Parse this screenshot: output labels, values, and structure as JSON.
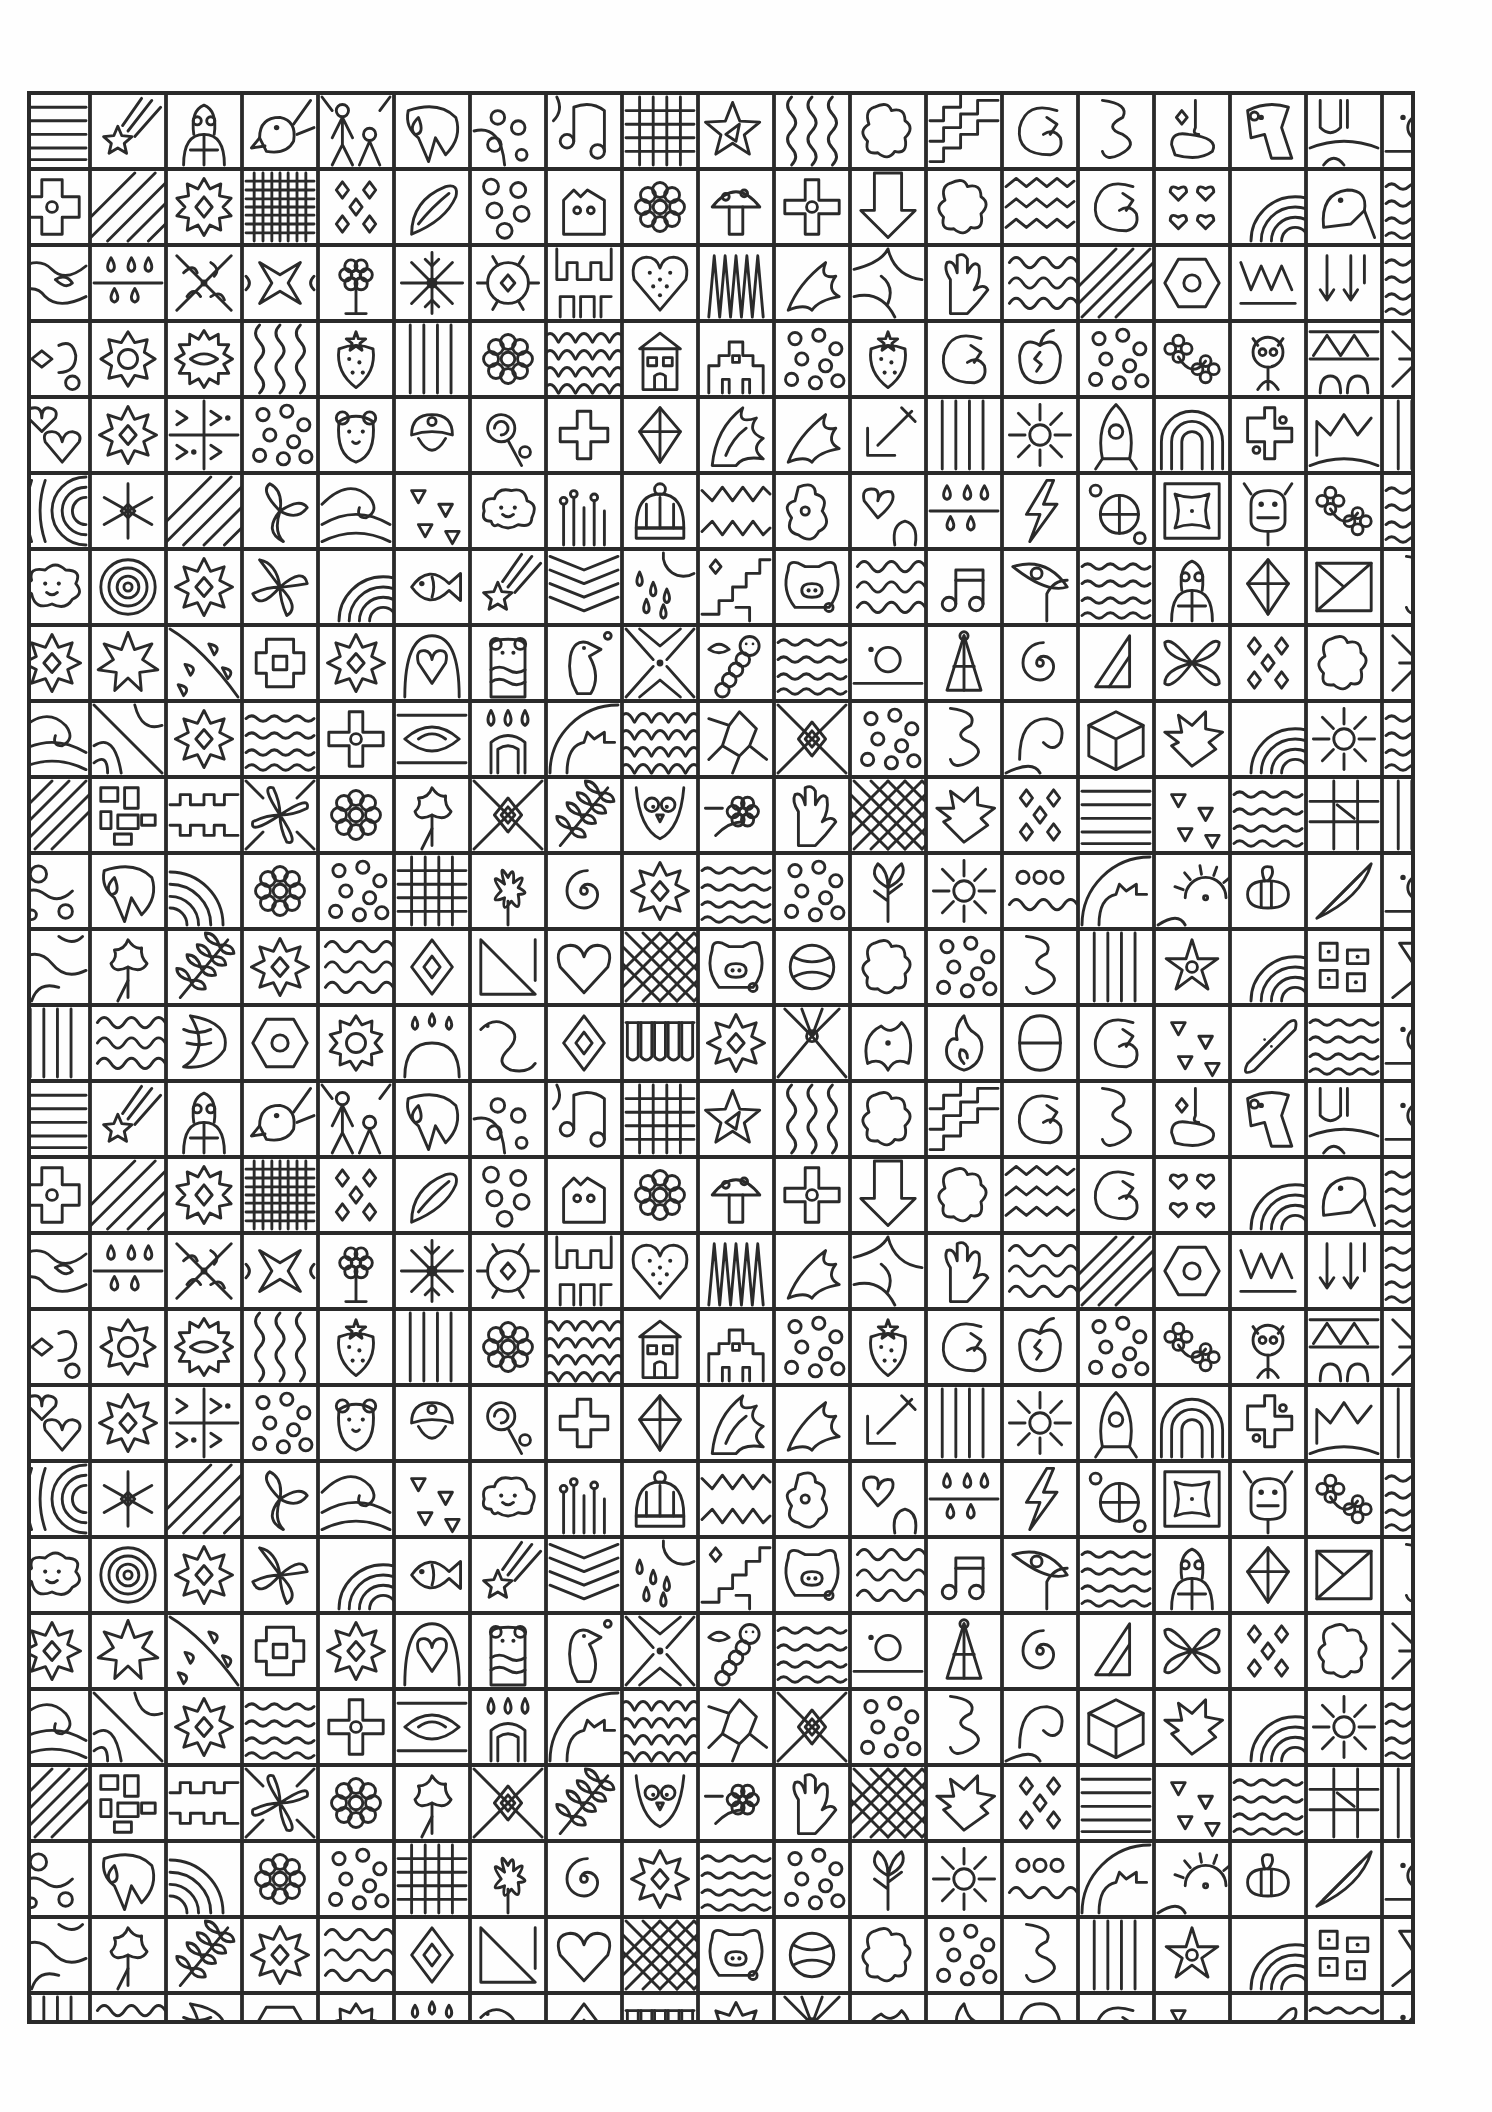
{
  "page": {
    "type": "coloring-page",
    "background_color": "#fefefe",
    "ink_color": "#2a2a2a"
  },
  "grid": {
    "left": 29,
    "top": 93,
    "right": 1413,
    "bottom": 2022,
    "first_col_width": 61,
    "cell": 76,
    "cols": 19,
    "rows": 26,
    "repeat_period_rows": 13,
    "border_width": 4,
    "line_width": 3.2
  },
  "motif_rows": [
    [
      "stripes-h",
      "shooting-star",
      "turtle",
      "bird",
      "figures",
      "leaf-drop",
      "dots-blob",
      "music-notes",
      "grid-coarse",
      "star-tri",
      "wavy-v",
      "puzzle-blob",
      "zigzag-steps",
      "swirl-c",
      "squiggle-s",
      "blob-oval",
      "dog-head",
      "wave-u",
      "dots-c"
    ],
    [
      "cross-block",
      "diag-lines",
      "sun-diamond",
      "grid-fine",
      "diamonds",
      "leaf-swirl",
      "circles",
      "house-cat",
      "flower",
      "mushroom",
      "flower-cross",
      "arrow-down",
      "puzzle-blob",
      "zigzag",
      "swirl-c",
      "hearts4",
      "rainbow",
      "leaf-bird",
      "wave-h"
    ],
    [
      "wavy-blob",
      "drops",
      "leaf-x",
      "cross-star",
      "flower-tree",
      "snowflake",
      "sun-gear",
      "castle",
      "heart-dots",
      "spikes",
      "leaf-flame",
      "blob-net",
      "hand",
      "squiggle",
      "diag-stripes",
      "hexagon",
      "zigzag-w",
      "arrows-down",
      "wave-h"
    ],
    [
      "diamond-c",
      "sun-flower",
      "flower-oval",
      "wavy-v",
      "strawberry",
      "stripes-v",
      "flower",
      "scales",
      "house",
      "castle2",
      "dots",
      "strawberry",
      "swirl-c",
      "apple",
      "dots",
      "flower4",
      "monkey",
      "triangles",
      "arrow-x"
    ],
    [
      "hearts",
      "star-diamond",
      "zigzag-grid",
      "dots",
      "bear",
      "mushroom-s",
      "lollipop",
      "plus",
      "gem",
      "flame",
      "leaf-flame",
      "arrow-dl",
      "stripes-v",
      "sun-ray",
      "rocket",
      "rainbow-u",
      "cross-dots",
      "zigzag-m",
      "stripes-v"
    ],
    [
      "arcs",
      "asterisk",
      "diag-lines",
      "leaf-3",
      "wave-swirl",
      "triangles-s",
      "cloud",
      "grass",
      "beanie",
      "wave-teeth",
      "blob-bead",
      "heart-blob",
      "drops",
      "lightning",
      "ball-x",
      "frame",
      "cow",
      "flower4",
      "wave-h"
    ],
    [
      "cloud-face",
      "target",
      "star-diamond",
      "pinwheel",
      "rainbow",
      "fish",
      "shooting-star",
      "chevrons",
      "drops-sun",
      "steps",
      "pig",
      "squiggle",
      "music-note",
      "leaf-eye",
      "wave-h",
      "turtle",
      "gem",
      "envelope",
      "squiggle-s"
    ],
    [
      "star-diamond",
      "leaf-star",
      "leaf-drops",
      "puzzle-cross",
      "star-diamond",
      "heart-arch",
      "bear-stripe",
      "bird2",
      "x-diamond",
      "worm",
      "wave-h",
      "dots-c",
      "tower",
      "spiral",
      "triangle",
      "x-leaf",
      "diamonds",
      "puzzle-blob",
      "arrow-x"
    ],
    [
      "wave-swirl",
      "diag-curves",
      "star-diamond",
      "wave-h",
      "flower-cross",
      "eye",
      "arch-drops",
      "gear-q",
      "scales",
      "net",
      "diamond-x",
      "dots",
      "squiggle-s",
      "leaf-curl",
      "cube",
      "leaf-spike",
      "rainbow",
      "sun-ray",
      "wave-h"
    ],
    [
      "diag-stripes",
      "blocks",
      "puzzle-row",
      "flower-x",
      "flower",
      "oak-leaf",
      "diamond-x",
      "branch",
      "owl",
      "bee-flower",
      "hand",
      "grid-diag",
      "leaf-spike",
      "diamonds",
      "stripes-h",
      "triangles-s",
      "wave-h",
      "grid-flag",
      "stripes-v"
    ],
    [
      "blob-circles",
      "leaf-drop",
      "rainbow-q",
      "flower",
      "dots",
      "grid-coarse",
      "flower-bloom",
      "spiral",
      "star-diamond",
      "wave-h",
      "dots",
      "leaf-tree",
      "sun-ray",
      "loops",
      "gear-q",
      "sun-face",
      "bee",
      "leaf-pen",
      "dots-c"
    ],
    [
      "wave-arc",
      "oak-leaf",
      "branch",
      "star-diamond",
      "squiggle",
      "diamond",
      "triangle-d",
      "heart",
      "grid-diag",
      "pig",
      "ball",
      "puzzle-blob",
      "dots",
      "squiggle-s",
      "stripes-v",
      "star-ring",
      "rainbow",
      "blocks-dots",
      "diag-tri"
    ],
    [
      "stripes-v",
      "squiggle",
      "moon-blob",
      "hexagon",
      "gear-flower",
      "drops-arch",
      "snake",
      "diamond",
      "teeth",
      "star-diamond",
      "sun-fan",
      "leaf-blob",
      "fire",
      "theta",
      "swirl-c",
      "triangles-s",
      "bandage",
      "wave-h",
      "dots-c"
    ]
  ]
}
